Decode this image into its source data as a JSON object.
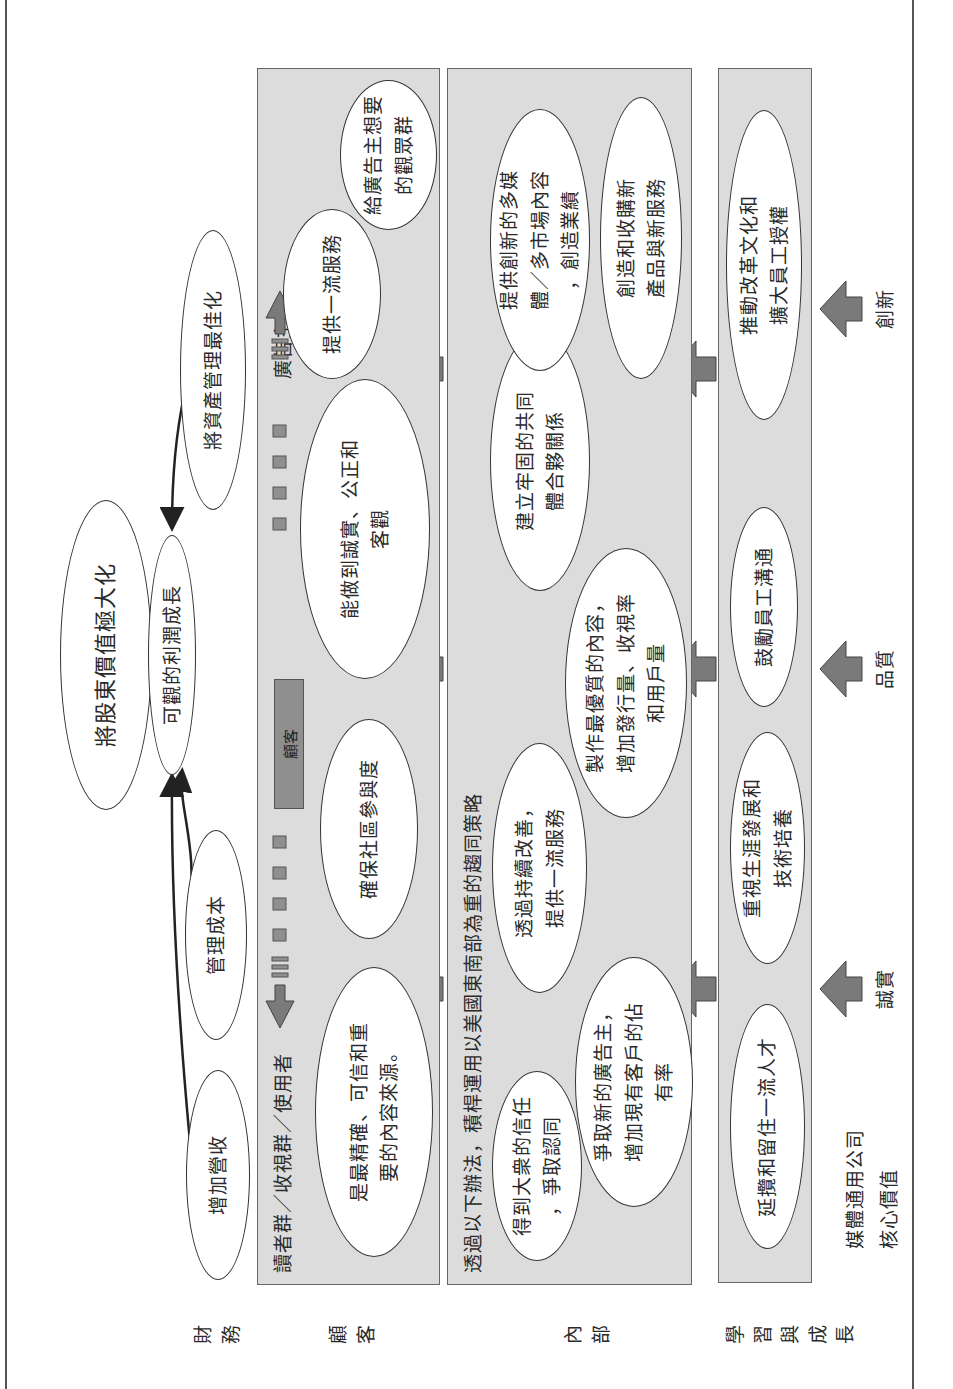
{
  "diagram": {
    "orientation": "rotated-90-ccw",
    "colors": {
      "panel": "#dcdcdc",
      "arrow": "#7a7a7a",
      "customer_tag": "#8f8f8f",
      "border": "#333333"
    }
  },
  "row_labels": {
    "financial": "財\n務",
    "customer": "顧\n客",
    "internal": "內\n部",
    "learning": "學\n習\n與\n成\n長"
  },
  "financial": {
    "top_goal": "將股東價值極大化",
    "profit": "可觀的利潤成長",
    "asset": "將資產管理最佳化",
    "cost": "管理成本",
    "revenue": "增加營收"
  },
  "customer": {
    "left_heading": "讀者群／收視群／使用者",
    "right_heading": "廣告主",
    "center_tag": "顧客",
    "ovals": [
      "是最精確、可信和重\n要的內容來源。",
      "確保社區參與度",
      "能做到誠實、公正和\n客觀",
      "提供一流服務",
      "給廣告主想要\n的觀眾群"
    ]
  },
  "internal": {
    "heading": "透過以下辦法，積桿運用以美國東南部為重的趨同策略",
    "ovals": [
      "得到大衆的信任\n，爭取認同",
      "爭取新的廣告主，\n增加現有客戶的佔\n有率",
      "透過持續改善，\n提供一流服務",
      "製作最優質的內容，\n增加發行量、收視率\n和用戶量",
      "建立牢固的共同\n體合夥關係",
      "提供創新的多媒\n體／多市場內容\n，創造業績",
      "創造和收購新\n產品與新服務"
    ]
  },
  "learning": {
    "ovals": [
      "延攬和留住一流人才",
      "重視生涯發展和\n技術培養",
      "鼓勵員工溝通",
      "推動改革文化和\n擴大員工授權"
    ]
  },
  "core_values": {
    "title": "媒體通用公司\n核心價值",
    "items": [
      "誠實",
      "品質",
      "創新"
    ]
  }
}
